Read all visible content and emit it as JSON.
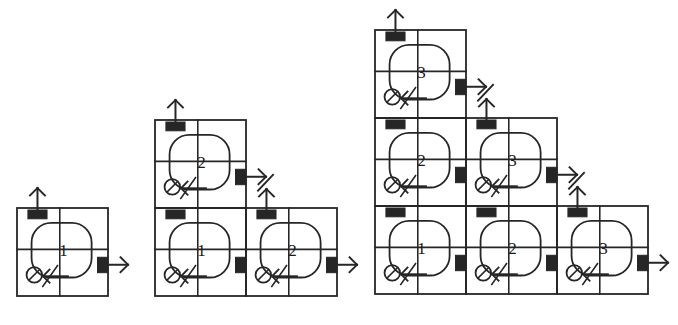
{
  "figure": {
    "type": "diagram",
    "title": "",
    "background_color": "#ffffff",
    "line_color": "#262626",
    "port_fill": "#262626",
    "number_color": "#1a1a1a",
    "cell_size": {
      "width": 91,
      "height": 88
    },
    "groups": [
      {
        "name": "group-1",
        "rows": 1,
        "origin": {
          "x": 17,
          "y": 208
        },
        "cells": [
          {
            "name": "cell-r0-c0",
            "label": "1",
            "row": 0,
            "col": 0,
            "top_port": true,
            "right_port": true,
            "top_arrow": "out-up",
            "right_arrow": "out-right"
          }
        ]
      },
      {
        "name": "group-2",
        "rows": 2,
        "origin": {
          "x": 155,
          "y": 120
        },
        "cells": [
          {
            "name": "cell-r1-c0",
            "label": "2",
            "row": 1,
            "col": 0,
            "top_port": true,
            "right_port": true,
            "top_arrow": "out-up",
            "right_arrow": "out-right-diagonal"
          },
          {
            "name": "cell-r0-c0",
            "label": "1",
            "row": 0,
            "col": 0,
            "top_port": true,
            "right_port": true,
            "top_arrow": "none",
            "right_arrow": "none"
          },
          {
            "name": "cell-r0-c1",
            "label": "2",
            "row": 0,
            "col": 1,
            "top_port": true,
            "right_port": true,
            "top_arrow": "in-up",
            "right_arrow": "out-right"
          }
        ]
      },
      {
        "name": "group-3",
        "rows": 3,
        "origin": {
          "x": 375,
          "y": 30
        },
        "cells": [
          {
            "name": "cell-r2-c0",
            "label": "3",
            "row": 2,
            "col": 0,
            "top_port": true,
            "right_port": true,
            "top_arrow": "out-up",
            "right_arrow": "out-right-diagonal"
          },
          {
            "name": "cell-r1-c0",
            "label": "2",
            "row": 1,
            "col": 0,
            "top_port": true,
            "right_port": true,
            "top_arrow": "none",
            "right_arrow": "none"
          },
          {
            "name": "cell-r1-c1",
            "label": "3",
            "row": 1,
            "col": 1,
            "top_port": true,
            "right_port": true,
            "top_arrow": "in-up",
            "right_arrow": "out-right-diagonal"
          },
          {
            "name": "cell-r0-c0",
            "label": "1",
            "row": 0,
            "col": 0,
            "top_port": true,
            "right_port": true,
            "top_arrow": "none",
            "right_arrow": "none"
          },
          {
            "name": "cell-r0-c1",
            "label": "2",
            "row": 0,
            "col": 1,
            "top_port": true,
            "right_port": true,
            "top_arrow": "none",
            "right_arrow": "none"
          },
          {
            "name": "cell-r0-c2",
            "label": "3",
            "row": 0,
            "col": 2,
            "top_port": true,
            "right_port": true,
            "top_arrow": "in-up",
            "right_arrow": "out-right"
          }
        ]
      }
    ]
  }
}
